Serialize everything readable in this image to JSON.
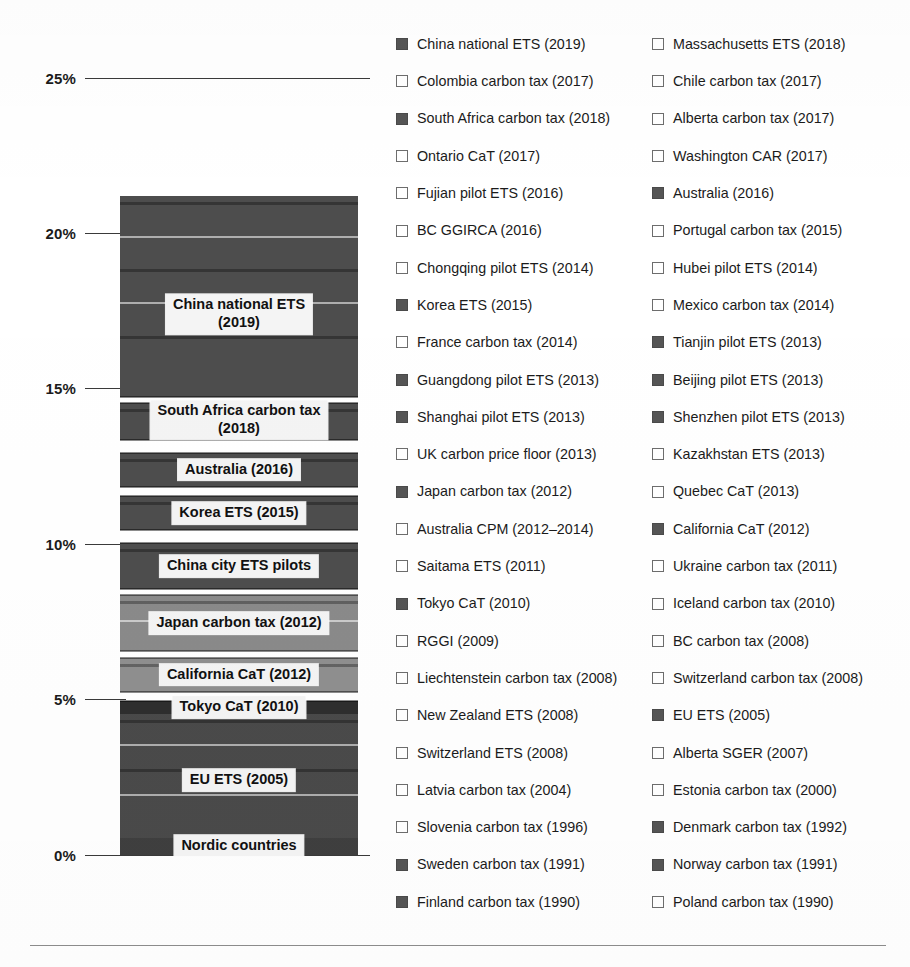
{
  "chart_data": {
    "type": "bar",
    "title": "",
    "xlabel": "",
    "ylabel": "",
    "ylim": [
      0,
      26
    ],
    "grid": false,
    "axis_ticks": [
      "0%",
      "5%",
      "10%",
      "15%",
      "20%",
      "25%"
    ],
    "axis_tick_values": [
      0,
      5,
      10,
      15,
      20,
      25
    ],
    "stack_total": 23.7,
    "orientation": "vertical",
    "stacked": true,
    "categories": [
      "Share of global GHG emissions covered"
    ],
    "segments": [
      {
        "label": "Nordic countries",
        "start": 0.0,
        "end": 0.55,
        "value": 0.55,
        "shade": "#3f3f3f",
        "labeled": true
      },
      {
        "label": "EU ETS (2005)",
        "start": 0.55,
        "end": 4.55,
        "value": 4.0,
        "shade": "#4a4a4a",
        "labeled": true
      },
      {
        "label": "Tokyo CaT (2010)",
        "start": 4.55,
        "end": 4.95,
        "value": 0.4,
        "shade": "#2e2e2e",
        "labeled": true
      },
      {
        "label": "California CaT (2012)",
        "start": 5.25,
        "end": 6.35,
        "value": 1.1,
        "shade": "#8f8f8f",
        "labeled": true
      },
      {
        "label": "Japan carbon tax (2012)",
        "start": 6.55,
        "end": 8.35,
        "value": 1.8,
        "shade": "#8a8a8a",
        "labeled": true
      },
      {
        "label": "China city ETS pilots",
        "start": 8.55,
        "end": 10.05,
        "value": 1.5,
        "shade": "#4d4d4d",
        "labeled": true
      },
      {
        "label": "Korea ETS (2015)",
        "start": 10.45,
        "end": 11.55,
        "value": 1.1,
        "shade": "#4d4d4d",
        "labeled": true
      },
      {
        "label": "Australia (2016)",
        "start": 11.85,
        "end": 12.95,
        "value": 1.1,
        "shade": "#4d4d4d",
        "labeled": true
      },
      {
        "label": "South Africa carbon tax (2018)",
        "start": 13.35,
        "end": 14.55,
        "value": 1.2,
        "shade": "#4d4d4d",
        "labeled": true
      },
      {
        "label": "China national ETS (2019)",
        "start": 14.75,
        "end": 21.2,
        "value": 6.45,
        "shade": "#4d4d4d",
        "labeled": true
      }
    ],
    "legend_position": "right",
    "legend_columns": 2,
    "legend": {
      "left_column": [
        {
          "label": "China national ETS (2019)",
          "marker": "filled"
        },
        {
          "label": "Colombia carbon tax (2017)",
          "marker": "hollow"
        },
        {
          "label": "South Africa carbon tax (2018)",
          "marker": "filled"
        },
        {
          "label": "Ontario CaT (2017)",
          "marker": "hollow"
        },
        {
          "label": "Fujian pilot ETS (2016)",
          "marker": "hollow"
        },
        {
          "label": "BC GGIRCA (2016)",
          "marker": "hollow"
        },
        {
          "label": "Chongqing pilot ETS (2014)",
          "marker": "hollow"
        },
        {
          "label": "Korea ETS (2015)",
          "marker": "filled"
        },
        {
          "label": "France carbon tax (2014)",
          "marker": "hollow"
        },
        {
          "label": "Guangdong pilot ETS (2013)",
          "marker": "filled"
        },
        {
          "label": "Shanghai pilot ETS (2013)",
          "marker": "filled"
        },
        {
          "label": "UK carbon price floor (2013)",
          "marker": "hollow"
        },
        {
          "label": "Japan carbon tax (2012)",
          "marker": "filled"
        },
        {
          "label": "Australia CPM (2012–2014)",
          "marker": "hollow"
        },
        {
          "label": "Saitama ETS (2011)",
          "marker": "hollow"
        },
        {
          "label": "Tokyo CaT (2010)",
          "marker": "filled"
        },
        {
          "label": "RGGI (2009)",
          "marker": "hollow"
        },
        {
          "label": "Liechtenstein carbon tax (2008)",
          "marker": "hollow"
        },
        {
          "label": "New Zealand ETS (2008)",
          "marker": "hollow"
        },
        {
          "label": "Switzerland ETS (2008)",
          "marker": "hollow"
        },
        {
          "label": "Latvia carbon tax (2004)",
          "marker": "hollow"
        },
        {
          "label": "Slovenia carbon tax (1996)",
          "marker": "hollow"
        },
        {
          "label": "Sweden carbon tax (1991)",
          "marker": "filled"
        },
        {
          "label": "Finland carbon tax (1990)",
          "marker": "filled"
        }
      ],
      "right_column": [
        {
          "label": "Massachusetts ETS (2018)",
          "marker": "hollow"
        },
        {
          "label": "Chile carbon tax (2017)",
          "marker": "hollow"
        },
        {
          "label": "Alberta carbon tax (2017)",
          "marker": "hollow"
        },
        {
          "label": "Washington CAR (2017)",
          "marker": "hollow"
        },
        {
          "label": "Australia (2016)",
          "marker": "filled"
        },
        {
          "label": "Portugal carbon tax (2015)",
          "marker": "hollow"
        },
        {
          "label": "Hubei pilot ETS (2014)",
          "marker": "hollow"
        },
        {
          "label": "Mexico carbon tax (2014)",
          "marker": "hollow"
        },
        {
          "label": "Tianjin pilot ETS (2013)",
          "marker": "filled"
        },
        {
          "label": "Beijing pilot ETS (2013)",
          "marker": "filled"
        },
        {
          "label": "Shenzhen pilot ETS (2013)",
          "marker": "filled"
        },
        {
          "label": "Kazakhstan ETS (2013)",
          "marker": "hollow"
        },
        {
          "label": "Quebec CaT (2013)",
          "marker": "hollow"
        },
        {
          "label": "California CaT (2012)",
          "marker": "filled"
        },
        {
          "label": "Ukraine carbon tax (2011)",
          "marker": "hollow"
        },
        {
          "label": "Iceland carbon tax (2010)",
          "marker": "hollow"
        },
        {
          "label": "BC carbon tax (2008)",
          "marker": "hollow"
        },
        {
          "label": "Switzerland carbon tax (2008)",
          "marker": "hollow"
        },
        {
          "label": "EU ETS (2005)",
          "marker": "filled"
        },
        {
          "label": "Alberta SGER (2007)",
          "marker": "hollow"
        },
        {
          "label": "Estonia carbon tax (2000)",
          "marker": "hollow"
        },
        {
          "label": "Denmark carbon tax (1992)",
          "marker": "filled"
        },
        {
          "label": "Norway carbon tax (1991)",
          "marker": "filled"
        },
        {
          "label": "Poland carbon tax (1990)",
          "marker": "hollow"
        }
      ]
    },
    "colors": {
      "filled_marker": "#555555",
      "hollow_marker_border": "#6d6d6d",
      "axis": "#3a3a3a",
      "text": "#1b1b1b",
      "label_background": "#f4f4f4",
      "footer_rule": "#8d8d8d"
    }
  }
}
